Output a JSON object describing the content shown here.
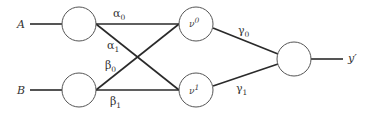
{
  "diagram": {
    "type": "neural-network",
    "inputs": [
      {
        "label": "A"
      },
      {
        "label": "B"
      }
    ],
    "hidden": [
      {
        "base": "ν",
        "sup": "0"
      },
      {
        "base": "ν",
        "sup": "1"
      }
    ],
    "output": {
      "label": "y′"
    },
    "weights": {
      "alpha0": {
        "base": "α",
        "sub": "0"
      },
      "alpha1": {
        "base": "α",
        "sub": "1"
      },
      "beta0": {
        "base": "β",
        "sub": "0"
      },
      "beta1": {
        "base": "β",
        "sub": "1"
      },
      "gamma0": {
        "base": "γ",
        "sub": "0"
      },
      "gamma1": {
        "base": "γ",
        "sub": "1"
      }
    },
    "colors": {
      "line": "#2a2a2a",
      "node_stroke": "#555555",
      "text": "#333333"
    }
  }
}
